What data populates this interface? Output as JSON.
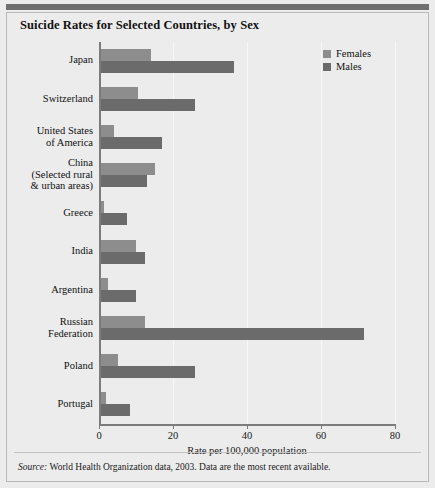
{
  "figure": {
    "title": "Suicide Rates for Selected Countries, by Sex",
    "source_prefix": "Source:",
    "source_text": "World Health Organization data, 2003. Data are the most recent available.",
    "colors": {
      "females": "#8d8d8e",
      "males": "#6b6b6c",
      "background": "#ececec",
      "axis": "#7c7c7c"
    }
  },
  "chart_data": {
    "type": "bar",
    "orientation": "horizontal",
    "title": "Suicide Rates for Selected Countries, by Sex",
    "xlabel": "Rate per 100,000 population",
    "ylabel": "",
    "xlim": [
      0,
      80
    ],
    "xticks": [
      0,
      20,
      40,
      60,
      80
    ],
    "xtick_labels": [
      "0",
      "20",
      "40",
      "60",
      "80"
    ],
    "grid": true,
    "legend_position": "top-right",
    "categories": [
      "Japan",
      "Switzerland",
      "United States\nof America",
      "China\n(Selected rural\n& urban areas)",
      "Greece",
      "India",
      "Argentina",
      "Russian\nFederation",
      "Poland",
      "Portugal"
    ],
    "category_labels": [
      [
        "Japan"
      ],
      [
        "Switzerland"
      ],
      [
        "United States",
        "of America"
      ],
      [
        "China",
        "(Selected rural",
        "& urban areas)"
      ],
      [
        "Greece"
      ],
      [
        "India"
      ],
      [
        "Argentina"
      ],
      [
        "Russian",
        "Federation"
      ],
      [
        "Poland"
      ],
      [
        "Portugal"
      ]
    ],
    "series": [
      {
        "name": "Females",
        "color": "#8d8d8e",
        "values": [
          14.0,
          10.5,
          4.0,
          15.0,
          1.3,
          10.0,
          2.5,
          12.5,
          5.0,
          2.0
        ]
      },
      {
        "name": "Males",
        "color": "#6b6b6c",
        "values": [
          36.5,
          26.0,
          17.0,
          13.0,
          7.5,
          12.5,
          10.0,
          71.5,
          26.0,
          8.5
        ]
      }
    ]
  },
  "legend": {
    "items": [
      {
        "label": "Females",
        "color": "#8d8d8e"
      },
      {
        "label": "Males",
        "color": "#6b6b6c"
      }
    ]
  }
}
